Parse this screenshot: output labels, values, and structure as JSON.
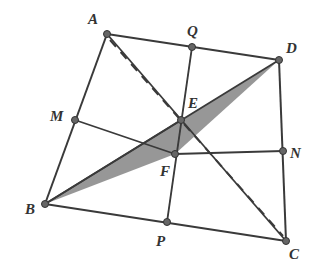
{
  "points": {
    "A": {
      "x": 107,
      "y": 34,
      "label": "A",
      "lx": 88,
      "ly": 24
    },
    "Q": {
      "x": 192,
      "y": 47,
      "label": "Q",
      "lx": 187,
      "ly": 36
    },
    "D": {
      "x": 279,
      "y": 60,
      "label": "D",
      "lx": 286,
      "ly": 53
    },
    "M": {
      "x": 75,
      "y": 120,
      "label": "M",
      "lx": 50,
      "ly": 121
    },
    "E": {
      "x": 181,
      "y": 120,
      "label": "E",
      "lx": 188,
      "ly": 108
    },
    "F": {
      "x": 175,
      "y": 154,
      "label": "F",
      "lx": 160,
      "ly": 176
    },
    "N": {
      "x": 283,
      "y": 151,
      "label": "N",
      "lx": 290,
      "ly": 158
    },
    "B": {
      "x": 45,
      "y": 204,
      "label": "B",
      "lx": 25,
      "ly": 214
    },
    "P": {
      "x": 167,
      "y": 222,
      "label": "P",
      "lx": 156,
      "ly": 246
    },
    "C": {
      "x": 286,
      "y": 241,
      "label": "C",
      "lx": 289,
      "ly": 259
    }
  },
  "colors": {
    "stroke": "#3a3a3a",
    "shade": "#8a8a8a"
  }
}
